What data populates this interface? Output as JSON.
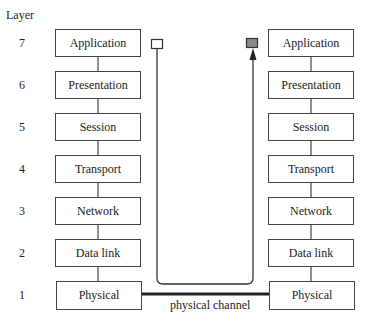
{
  "diagram": {
    "axis_label": "Layer",
    "layers": [
      {
        "number": "7",
        "name": "Application"
      },
      {
        "number": "6",
        "name": "Presentation"
      },
      {
        "number": "5",
        "name": "Session"
      },
      {
        "number": "4",
        "name": "Transport"
      },
      {
        "number": "3",
        "name": "Network"
      },
      {
        "number": "2",
        "name": "Data link"
      },
      {
        "number": "1",
        "name": "Physical"
      }
    ],
    "left_stack": [
      "Application",
      "Presentation",
      "Session",
      "Transport",
      "Network",
      "Data link",
      "Physical"
    ],
    "right_stack": [
      "Application",
      "Presentation",
      "Session",
      "Transport",
      "Network",
      "Data link",
      "Physical"
    ],
    "channel_label": "physical channel",
    "source_marker": "open-square",
    "destination_marker": "filled-square",
    "colors": {
      "line": "#444444",
      "channel": "#222222",
      "filled_marker": "#8a8a8a"
    }
  }
}
